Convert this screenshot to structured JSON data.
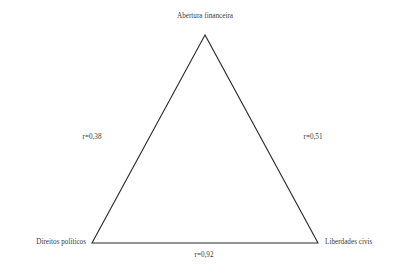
{
  "diagram": {
    "type": "triangle-correlation-diagram",
    "stroke_color": "#2b2b2b",
    "text_color": "#3a3a3a",
    "background_color": "#ffffff",
    "vertices": [
      {
        "id": "top",
        "label": "Abertura financeira"
      },
      {
        "id": "bottom_left",
        "label": "Direitos políticos"
      },
      {
        "id": "bottom_right",
        "label": "Liberdades civis"
      }
    ],
    "edges": [
      {
        "id": "left",
        "label": "r=0,38",
        "value": 0.38,
        "connects": [
          "Abertura financeira",
          "Direitos políticos"
        ]
      },
      {
        "id": "right",
        "label": "r=0,51",
        "value": 0.51,
        "connects": [
          "Abertura financeira",
          "Liberdades civis"
        ]
      },
      {
        "id": "bottom",
        "label": "r=0,92",
        "value": 0.92,
        "connects": [
          "Direitos políticos",
          "Liberdades civis"
        ]
      }
    ]
  }
}
